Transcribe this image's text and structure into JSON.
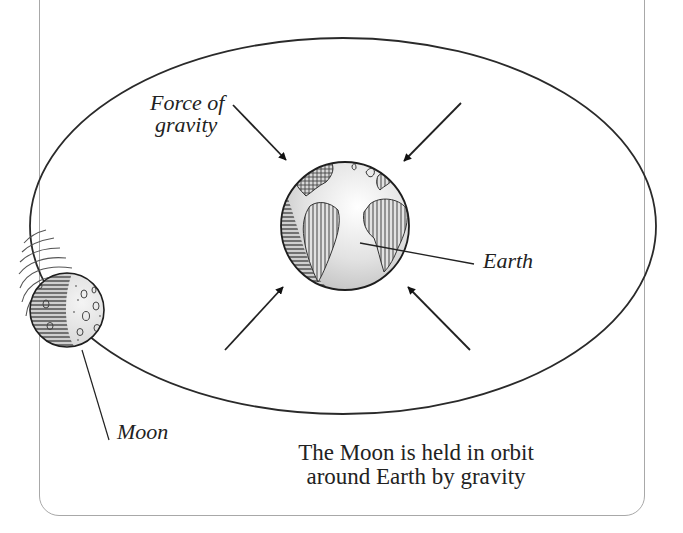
{
  "diagram": {
    "title": "The Moon is held in orbit around Earth by gravity",
    "caption_lines": [
      "The Moon is held in orbit",
      "around Earth by gravity"
    ],
    "labels": {
      "force_line1": "Force of",
      "force_line2": "gravity",
      "earth": "Earth",
      "moon": "Moon"
    },
    "elements": {
      "orbit": "elliptical orbit path",
      "earth": "Earth globe showing the Americas, Europe and Africa",
      "moon": "cratered Moon with motion lines",
      "arrows": [
        "force-arrow-top-left",
        "force-arrow-top-right",
        "force-arrow-bottom-left",
        "force-arrow-bottom-right"
      ]
    },
    "colors": {
      "ink": "#222222",
      "frame": "#a8a8a8",
      "globe_fill": "#e4e4e4",
      "background": "#ffffff"
    }
  }
}
